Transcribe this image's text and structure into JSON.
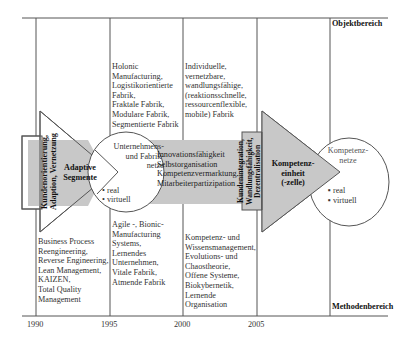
{
  "diagram": {
    "labels": {
      "top_right": "Objektbereich",
      "bottom_right": "Methodenbereich"
    },
    "timeline": {
      "ticks": [
        "1990",
        "1995",
        "2000",
        "2005"
      ]
    },
    "top_row": {
      "col2": "Holonic\nManufacturing,\nLogistikorientierte\nFabrik,\nFraktale Fabrik,\nModulare Fabrik,\nSegmentierte Fabrik",
      "col3": "Individuelle,\nvernetzbare,\nwandlungsfähige,\n(reaktionsschnelle,\nressourcenflexible,\nmobile) Fabrik"
    },
    "bottom_row": {
      "col1": "Business Process\nReengineering,\nReverse Engineering,\nLean Management,\nKAIZEN,\nTotal Quality\nManagement",
      "col2": "Agile -, Bionic-\nManufacturing\nSystems,\nLernendes\nUnternehmen,\nVitale Fabrik,\nAtmende Fabrik",
      "col3": "Kompetenz- und\nWissensmanagement,\nEvolutions- und\nChaostheorie,\nOffene Systeme,\nBiokybernetik,\nLernende\nOrganisation"
    },
    "arrow1": {
      "vertical_label": "Kundenorientierung,\nAdaption, Vernetzung",
      "title": "Adaptive\nSegmente"
    },
    "circle1": {
      "title": "Unternehmens-\nund Fabrik-\nnetze",
      "bullets": [
        "real",
        "virtuell"
      ]
    },
    "band": {
      "lines": "Innovationsfähigkeit\nSelbstorganisation\nKompetenzvermarktung\nMitarbeiterpartizipation"
    },
    "arrow2": {
      "vertical_label": "Kundenintegration,\nWandlungsfähigkeit,\nDezentralisation",
      "title": "Kompetenz-\neinheit\n(-zelle)"
    },
    "circle2": {
      "title": "Kompetenz-\nnetze",
      "bullets": [
        "real",
        "virtuell"
      ]
    },
    "colors": {
      "line": "#555555",
      "fill_gray": "#c8c8c8",
      "background": "#ffffff"
    }
  }
}
